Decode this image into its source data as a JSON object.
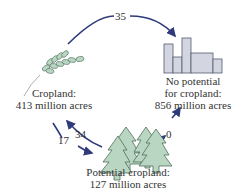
{
  "nodes": {
    "cropland": {
      "line1": "Cropland:",
      "line2": "413 million acres",
      "icon": "wheat-icon"
    },
    "no_potential": {
      "line1": "No potential",
      "line2": "for cropland:",
      "line3": "856 million acres",
      "icon": "buildings-icon"
    },
    "potential": {
      "line1": "Potential cropland:",
      "line2": "127 million acres",
      "icon": "trees-icon"
    }
  },
  "flows": {
    "cropland_to_no_potential": "35",
    "cropland_to_potential": "17",
    "potential_to_cropland": "34",
    "potential_to_no_potential": "0"
  },
  "colors": {
    "arrow": "#2e3a7a",
    "plant_fill": "#b9d6c2",
    "plant_stroke": "#4e6e5a",
    "building_fill": "#d3d6e0",
    "building_stroke": "#555a70"
  }
}
